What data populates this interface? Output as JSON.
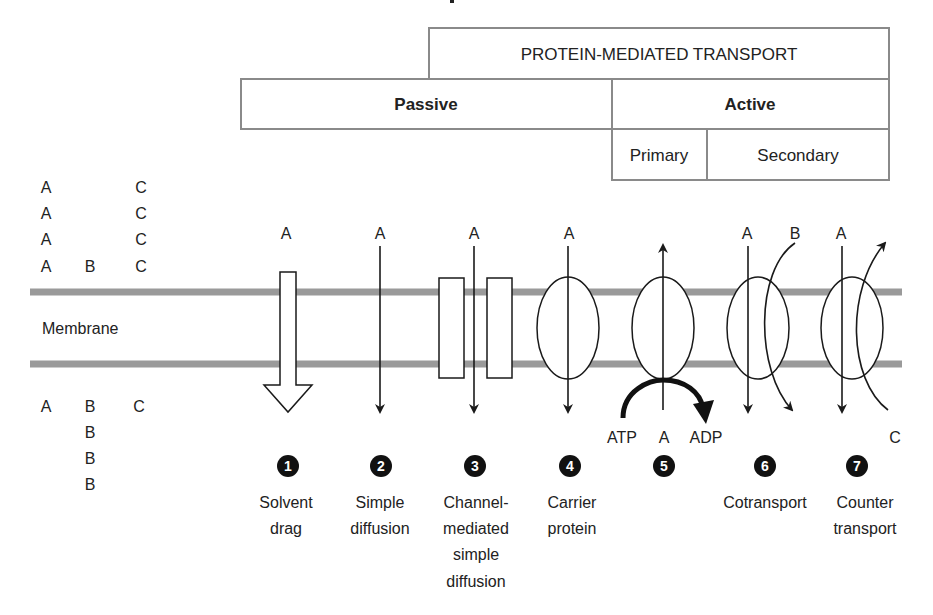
{
  "header": {
    "top_band": "PROTEIN-MEDIATED TRANSPORT",
    "passive": "Passive",
    "active": "Active",
    "primary": "Primary",
    "secondary": "Secondary"
  },
  "membrane": {
    "label": "Membrane"
  },
  "outside_molecules": {
    "col_a": [
      "A",
      "A",
      "A",
      "A"
    ],
    "col_b": [
      "B"
    ],
    "col_c": [
      "C",
      "C",
      "C",
      "C"
    ]
  },
  "inside_molecules": {
    "col_a": [
      "A"
    ],
    "col_b": [
      "B",
      "B",
      "B",
      "B"
    ],
    "col_c": [
      "C"
    ]
  },
  "mechanisms": [
    {
      "number": "1",
      "molecule_top": "A",
      "label_lines": [
        "Solvent",
        "drag"
      ]
    },
    {
      "number": "2",
      "molecule_top": "A",
      "label_lines": [
        "Simple",
        "diffusion"
      ]
    },
    {
      "number": "3",
      "molecule_top": "A",
      "label_lines": [
        "Channel-",
        "mediated",
        "simple",
        "diffusion"
      ]
    },
    {
      "number": "4",
      "molecule_top": "A",
      "label_lines": [
        "Carrier",
        "protein"
      ]
    },
    {
      "number": "5",
      "molecule_bottom": "A",
      "atp": "ATP",
      "adp": "ADP",
      "label_lines": []
    },
    {
      "number": "6",
      "molecule_top": "A",
      "molecule_top_2": "B",
      "label_lines": [
        "Cotransport"
      ]
    },
    {
      "number": "7",
      "molecule_top": "A",
      "molecule_bottom_2": "C",
      "label_lines": [
        "Counter",
        "transport"
      ]
    }
  ]
}
